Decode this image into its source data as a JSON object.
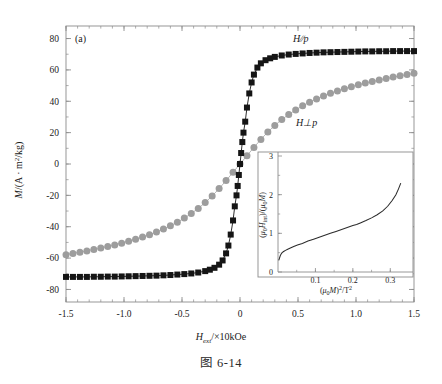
{
  "figure": {
    "panel_label": "(a)",
    "caption": "图 6-14"
  },
  "main_axes": {
    "xlabel_var": "H",
    "xlabel_sub": "ext",
    "xlabel_rest": "/×10kOe",
    "ylabel": "M/(A · m2/kg)",
    "xticks": [
      "-1.5",
      "-1.0",
      "-0.5",
      "0",
      "0.5",
      "1.0",
      "1.5"
    ],
    "yticks": [
      "80",
      "60",
      "40",
      "20",
      "0",
      "-20",
      "-40",
      "-60",
      "-80"
    ],
    "series_label_parallel": "H∕∕p",
    "series_label_perp": "H⊥p"
  },
  "inset_axes": {
    "xlabel": "(μ0M)2/T2",
    "ylabel": "(μ0Hint)/(μ0M)",
    "xticks": [
      "0.1",
      "0.2",
      "0.3"
    ],
    "yticks": [
      "0",
      "1",
      "2",
      "3"
    ]
  },
  "colors": {
    "parallel": "#151515",
    "perpendicular": "#9d9d9d",
    "axis": "#8c8c8c",
    "inset_line": "#2b2b2b",
    "background": "#ffffff"
  },
  "chart_data": {
    "type": "scatter",
    "title": "",
    "xlabel": "Hext/×10kOe",
    "ylabel": "M/(A·m2/kg)",
    "xlim": [
      -1.5,
      1.5
    ],
    "ylim": [
      -88,
      88
    ],
    "xticks": [
      -1.5,
      -1.0,
      -0.5,
      0,
      0.5,
      1.0,
      1.5
    ],
    "yticks": [
      80,
      60,
      40,
      20,
      0,
      -20,
      -40,
      -60,
      -80
    ],
    "grid": false,
    "legend": "inline-annotations",
    "series": [
      {
        "name": "H//p",
        "marker": "square",
        "color": "#151515",
        "x": [
          -1.5,
          -1.44,
          -1.38,
          -1.32,
          -1.26,
          -1.2,
          -1.14,
          -1.08,
          -1.02,
          -0.96,
          -0.9,
          -0.84,
          -0.78,
          -0.72,
          -0.66,
          -0.6,
          -0.54,
          -0.48,
          -0.42,
          -0.36,
          -0.3,
          -0.26,
          -0.22,
          -0.18,
          -0.15,
          -0.12,
          -0.1,
          -0.08,
          -0.06,
          -0.045,
          -0.03,
          -0.02,
          -0.01,
          0,
          0.01,
          0.02,
          0.03,
          0.045,
          0.06,
          0.08,
          0.1,
          0.12,
          0.15,
          0.18,
          0.22,
          0.26,
          0.3,
          0.36,
          0.42,
          0.48,
          0.54,
          0.6,
          0.66,
          0.72,
          0.78,
          0.84,
          0.9,
          0.96,
          1.02,
          1.08,
          1.14,
          1.2,
          1.26,
          1.32,
          1.38,
          1.44,
          1.5
        ],
        "y": [
          -72.0,
          -72.0,
          -72.0,
          -72.0,
          -71.9,
          -71.9,
          -71.8,
          -71.8,
          -71.7,
          -71.6,
          -71.5,
          -71.4,
          -71.3,
          -71.2,
          -71.0,
          -70.8,
          -70.5,
          -70.2,
          -69.8,
          -69.2,
          -68.3,
          -67.4,
          -66.2,
          -64.2,
          -61.5,
          -57.0,
          -52.0,
          -45.0,
          -36.0,
          -27.0,
          -20.0,
          -14.0,
          -7.0,
          0.0,
          7.0,
          14.0,
          20.0,
          27.0,
          36.0,
          45.0,
          52.0,
          57.0,
          61.5,
          64.2,
          66.2,
          67.4,
          68.3,
          69.2,
          69.8,
          70.2,
          70.5,
          70.8,
          71.0,
          71.2,
          71.3,
          71.4,
          71.5,
          71.6,
          71.7,
          71.8,
          71.8,
          71.9,
          71.9,
          72.0,
          72.0,
          72.0,
          72.0
        ]
      },
      {
        "name": "H⊥p",
        "marker": "circle",
        "color": "#9d9d9d",
        "x": [
          -1.5,
          -1.44,
          -1.38,
          -1.32,
          -1.26,
          -1.2,
          -1.14,
          -1.08,
          -1.02,
          -0.96,
          -0.9,
          -0.84,
          -0.78,
          -0.72,
          -0.66,
          -0.6,
          -0.54,
          -0.48,
          -0.42,
          -0.36,
          -0.3,
          -0.24,
          -0.18,
          -0.12,
          -0.06,
          0,
          0.06,
          0.12,
          0.18,
          0.24,
          0.3,
          0.36,
          0.42,
          0.48,
          0.54,
          0.6,
          0.66,
          0.72,
          0.78,
          0.84,
          0.9,
          0.96,
          1.02,
          1.08,
          1.14,
          1.2,
          1.26,
          1.32,
          1.38,
          1.44,
          1.5
        ],
        "y": [
          -57.8,
          -57.0,
          -56.2,
          -55.4,
          -54.5,
          -53.6,
          -52.6,
          -51.6,
          -50.5,
          -49.3,
          -48.0,
          -46.6,
          -45.1,
          -43.4,
          -41.5,
          -39.4,
          -37.1,
          -34.5,
          -31.6,
          -28.3,
          -24.6,
          -20.4,
          -15.7,
          -10.6,
          -5.3,
          0.0,
          5.3,
          10.6,
          15.7,
          20.4,
          24.6,
          28.3,
          31.6,
          34.5,
          37.1,
          39.4,
          41.5,
          43.4,
          45.1,
          46.6,
          48.0,
          49.3,
          50.5,
          51.6,
          52.6,
          53.6,
          54.5,
          55.4,
          56.2,
          57.0,
          57.8
        ]
      }
    ],
    "inset": {
      "type": "line",
      "xlabel": "(μ0M)2/T2",
      "ylabel": "(μ0Hint)/(μ0M)",
      "xlim": [
        0,
        0.35
      ],
      "ylim": [
        0,
        3
      ],
      "xticks": [
        0.1,
        0.2,
        0.3
      ],
      "yticks": [
        0,
        1,
        2,
        3
      ],
      "x": [
        0.002,
        0.004,
        0.006,
        0.008,
        0.011,
        0.015,
        0.02,
        0.026,
        0.033,
        0.042,
        0.052,
        0.065,
        0.08,
        0.095,
        0.11,
        0.125,
        0.14,
        0.155,
        0.17,
        0.185,
        0.2,
        0.21,
        0.22,
        0.235,
        0.25,
        0.265,
        0.28,
        0.293,
        0.305,
        0.315,
        0.322,
        0.328
      ],
      "y": [
        0.3,
        0.36,
        0.42,
        0.46,
        0.5,
        0.53,
        0.56,
        0.59,
        0.62,
        0.66,
        0.7,
        0.74,
        0.8,
        0.85,
        0.9,
        0.95,
        1.0,
        1.05,
        1.1,
        1.15,
        1.2,
        1.23,
        1.27,
        1.33,
        1.4,
        1.48,
        1.58,
        1.7,
        1.85,
        2.0,
        2.15,
        2.3
      ]
    }
  }
}
